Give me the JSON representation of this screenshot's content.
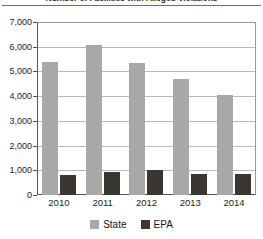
{
  "chart_data": {
    "type": "bar",
    "title": "Number of Facilities with Alleged Violations",
    "categories": [
      "2010",
      "2011",
      "2012",
      "2013",
      "2014"
    ],
    "series": [
      {
        "name": "State",
        "color": "#a8a8a8",
        "values": [
          5400,
          6050,
          5350,
          4700,
          4050
        ]
      },
      {
        "name": "EPA",
        "color": "#3a3632",
        "values": [
          820,
          930,
          1000,
          870,
          850
        ]
      }
    ],
    "xlabel": "",
    "ylabel": "",
    "ylim": [
      0,
      7000
    ],
    "ytick_labels": [
      "0",
      "1,000",
      "2,000",
      "3,000",
      "4,000",
      "5,000",
      "6,000",
      "7,000"
    ],
    "ytick_values": [
      0,
      1000,
      2000,
      3000,
      4000,
      5000,
      6000,
      7000
    ],
    "grid": true,
    "legend_position": "bottom"
  },
  "legend": {
    "items": [
      {
        "label": "State",
        "color": "#a8a8a8"
      },
      {
        "label": "EPA",
        "color": "#3a3632"
      }
    ]
  }
}
